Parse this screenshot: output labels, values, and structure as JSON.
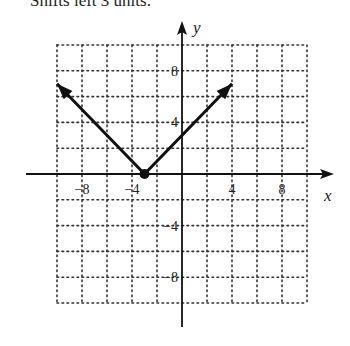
{
  "caption": "Shifts left 3 units.",
  "chart_data": {
    "type": "line",
    "title": "",
    "function": "y = |x + 3|",
    "xlabel": "x",
    "ylabel": "y",
    "xlim": [
      -10,
      10
    ],
    "ylim": [
      -10,
      10
    ],
    "grid": true,
    "grid_step": 2,
    "grid_style": "dotted",
    "x_tick_labels": [
      "-8",
      "-4",
      "4",
      "8"
    ],
    "x_ticks": [
      -8,
      -4,
      4,
      8
    ],
    "y_tick_labels": [
      "8",
      "4",
      "-4",
      "-8"
    ],
    "y_ticks": [
      8,
      4,
      -4,
      -8
    ],
    "series": [
      {
        "name": "y = |x + 3|",
        "x": [
          -10,
          -3,
          4
        ],
        "y": [
          7,
          0,
          7
        ],
        "vertex": [
          -3,
          0
        ],
        "arrows_at_ends": true
      }
    ],
    "legend": null
  }
}
